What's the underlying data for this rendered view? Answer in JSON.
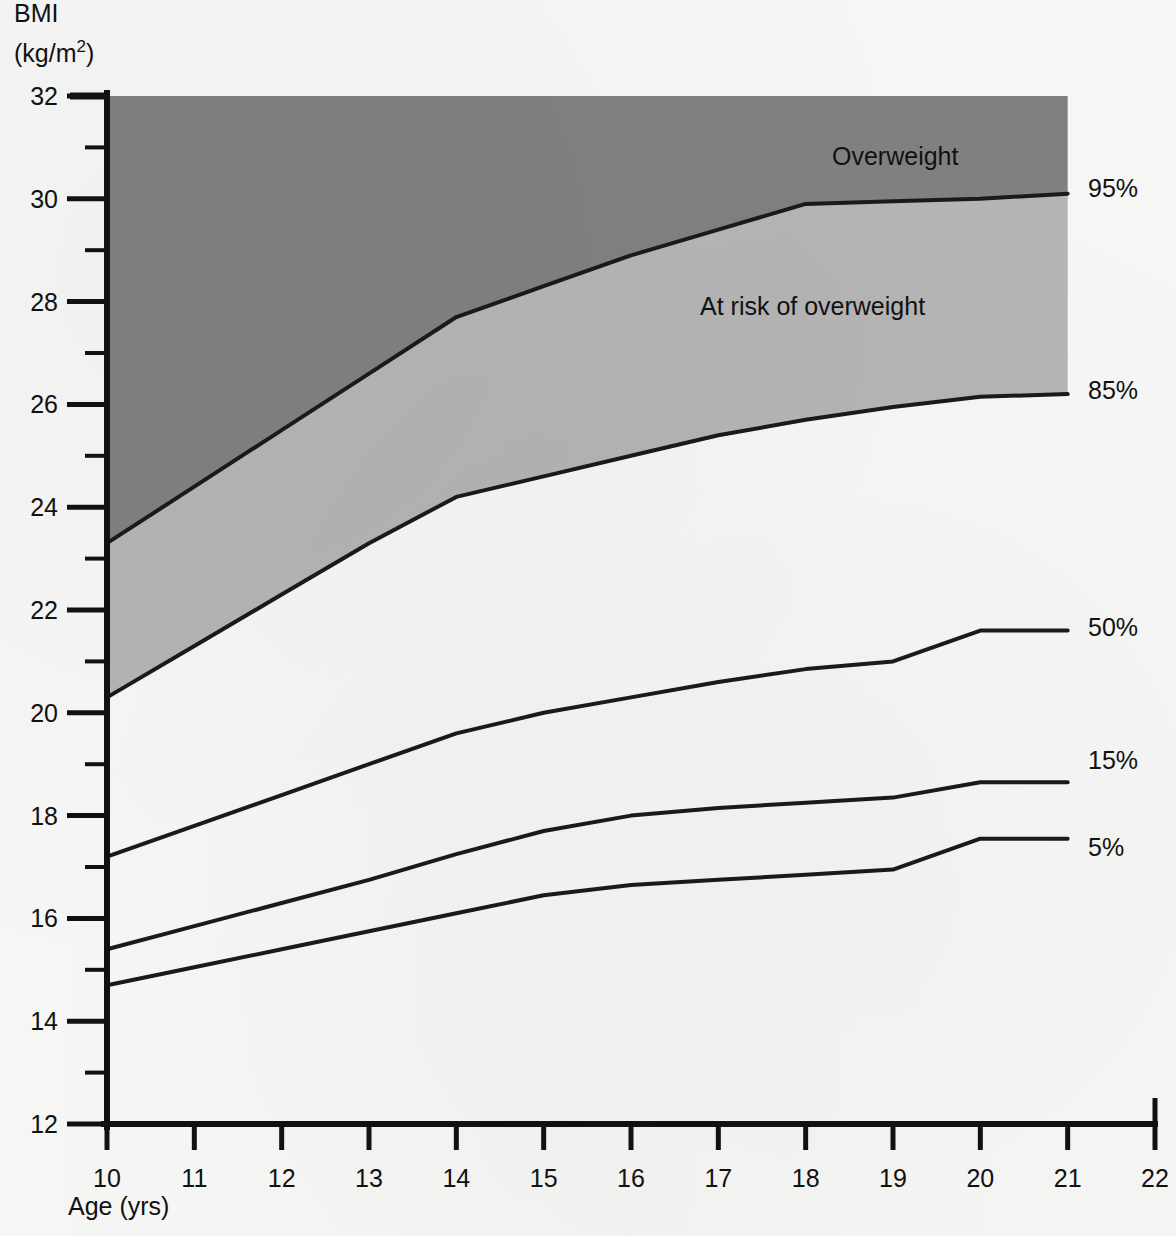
{
  "chart_data": {
    "type": "line",
    "title": "",
    "subtitle": "",
    "ylabel_line1": "BMI",
    "ylabel_line2_pre": "(kg/m",
    "ylabel_line2_sup": "2",
    "ylabel_line2_post": ")",
    "xlabel": "Age (yrs)",
    "xlim": [
      10,
      22
    ],
    "ylim": [
      12,
      32
    ],
    "x_major_step": 1,
    "y_major_step": 2,
    "y_minor_step": 1,
    "grid": false,
    "legend_position": "right-inline",
    "x_ticklabels": [
      "10",
      "11",
      "12",
      "13",
      "14",
      "15",
      "16",
      "17",
      "18",
      "19",
      "20",
      "21",
      "22"
    ],
    "y_ticklabels": [
      "12",
      "14",
      "16",
      "18",
      "20",
      "22",
      "24",
      "26",
      "28",
      "30",
      "32"
    ],
    "series": [
      {
        "name": "95%",
        "label": "95%",
        "label_value_at_end": 30.1,
        "x": [
          10,
          11,
          12,
          13,
          14,
          15,
          16,
          17,
          18,
          19,
          20,
          21
        ],
        "values": [
          23.3,
          24.4,
          25.5,
          26.6,
          27.7,
          28.3,
          28.9,
          29.4,
          29.9,
          29.95,
          30.0,
          30.1
        ]
      },
      {
        "name": "85%",
        "label": "85%",
        "label_value_at_end": 26.2,
        "x": [
          10,
          11,
          12,
          13,
          14,
          15,
          16,
          17,
          18,
          19,
          20,
          21
        ],
        "values": [
          20.3,
          21.3,
          22.3,
          23.3,
          24.2,
          24.6,
          25.0,
          25.4,
          25.7,
          25.95,
          26.15,
          26.2
        ]
      },
      {
        "name": "50%",
        "label": "50%",
        "label_value_at_end": 21.6,
        "x": [
          10,
          11,
          12,
          13,
          14,
          15,
          16,
          17,
          18,
          19,
          20,
          21
        ],
        "values": [
          17.2,
          17.8,
          18.4,
          19.0,
          19.6,
          20.0,
          20.3,
          20.6,
          20.85,
          21.0,
          21.6,
          21.6
        ]
      },
      {
        "name": "15%",
        "label": "15%",
        "label_value_at_end": 18.65,
        "x": [
          10,
          11,
          12,
          13,
          14,
          15,
          16,
          17,
          18,
          19,
          20,
          21
        ],
        "values": [
          15.4,
          15.85,
          16.3,
          16.75,
          17.25,
          17.7,
          18.0,
          18.15,
          18.25,
          18.35,
          18.65,
          18.65
        ]
      },
      {
        "name": "5%",
        "label": "5%",
        "label_value_at_end": 17.55,
        "x": [
          10,
          11,
          12,
          13,
          14,
          15,
          16,
          17,
          18,
          19,
          20,
          21
        ],
        "values": [
          14.7,
          15.05,
          15.4,
          15.75,
          16.1,
          16.45,
          16.65,
          16.75,
          16.85,
          16.95,
          17.55,
          17.55
        ]
      }
    ],
    "regions": [
      {
        "name": "overweight",
        "label": "Overweight",
        "bounded_below_by": "95%",
        "bounded_above_by": "top-of-axis",
        "fill": "#808080",
        "label_x": 17.4,
        "label_y": 31.0
      },
      {
        "name": "at-risk-of-overweight",
        "label": "At risk of overweight",
        "bounded_below_by": "85%",
        "bounded_above_by": "95%",
        "fill": "#b4b4b4",
        "label_x": 16.6,
        "label_y": 27.9
      }
    ],
    "colors": {
      "curve_line": "#1a1a1a",
      "axis": "#111111",
      "overweight_band": "#808080",
      "at_risk_band": "#b4b4b4",
      "plot_background": "#f6f6f4",
      "page_background": "#f6f6f4"
    }
  }
}
